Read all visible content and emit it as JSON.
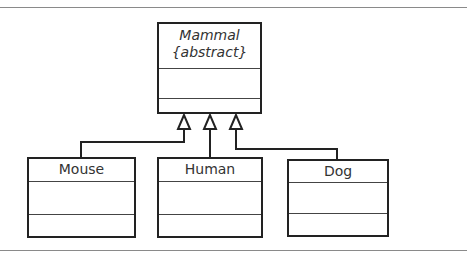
{
  "diagram": {
    "type": "UML class inheritance",
    "parent": {
      "name": "Mammal",
      "stereotype": "{abstract}"
    },
    "children": [
      {
        "name": "Mouse"
      },
      {
        "name": "Human"
      },
      {
        "name": "Dog"
      }
    ],
    "relationship": "generalization"
  }
}
